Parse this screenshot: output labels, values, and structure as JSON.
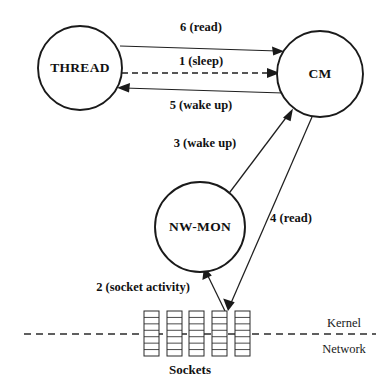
{
  "figure": {
    "background_color": "#ffffff",
    "ink_color": "#1a1a1a"
  },
  "nodes": [
    {
      "id": "thread",
      "label": "THREAD",
      "cx": 80,
      "cy": 68,
      "r": 42
    },
    {
      "id": "cm",
      "label": "CM",
      "cx": 320,
      "cy": 74,
      "r": 43
    },
    {
      "id": "nwmon",
      "label": "NW-MON",
      "cx": 200,
      "cy": 227,
      "r": 45
    }
  ],
  "edges": [
    {
      "id": "edge-6-read",
      "label": "6 (read)",
      "from": "thread",
      "to": "cm",
      "style": "solid",
      "direction": "right",
      "label_x": 201,
      "label_y": 31,
      "x1": 120,
      "y1": 46,
      "x2": 281,
      "y2": 51
    },
    {
      "id": "edge-1-sleep",
      "label": "1 (sleep)",
      "from": "thread",
      "to": "cm",
      "style": "dashed",
      "direction": "right",
      "label_x": 201,
      "label_y": 65,
      "x1": 122,
      "y1": 73,
      "x2": 276,
      "y2": 73
    },
    {
      "id": "edge-5-wakeup",
      "label": "5 (wake up)",
      "from": "cm",
      "to": "thread",
      "style": "solid",
      "direction": "left",
      "label_x": 201,
      "label_y": 109,
      "x1": 283,
      "y1": 93,
      "x2": 119,
      "y2": 88
    },
    {
      "id": "edge-3-wakeup",
      "label": "3 (wake up)",
      "from": "nwmon",
      "to": "cm",
      "style": "solid",
      "direction": "up-right",
      "label_x": 205,
      "label_y": 147,
      "x1": 227,
      "y1": 196,
      "x2": 292,
      "y2": 111
    },
    {
      "id": "edge-4-read",
      "label": "4 (read)",
      "from": "cm",
      "to": "socket",
      "style": "solid",
      "direction": "down-left",
      "label_x": 291,
      "label_y": 222,
      "x1": 312,
      "y1": 117,
      "x2": 228,
      "y2": 310
    },
    {
      "id": "edge-2-socket-activity",
      "label": "2 (socket activity)",
      "from": "socket",
      "to": "nwmon",
      "style": "solid",
      "direction": "up-left",
      "label_x": 143,
      "label_y": 291,
      "x1": 225,
      "y1": 310,
      "x2": 205,
      "y2": 269
    }
  ],
  "boundary": {
    "id": "kernel-network-boundary",
    "y": 334,
    "x1": 24,
    "x2": 376,
    "above_label": "Kernel",
    "above_label_x": 344,
    "above_label_y": 327,
    "below_label": "Network",
    "below_label_x": 344,
    "below_label_y": 353
  },
  "sockets": {
    "caption": "Sockets",
    "caption_x": 190,
    "caption_y": 374,
    "count": 5,
    "segments_per_socket": 7,
    "width": 15,
    "height": 45,
    "top": 311,
    "x_positions": [
      144,
      167,
      189,
      212,
      235
    ]
  }
}
